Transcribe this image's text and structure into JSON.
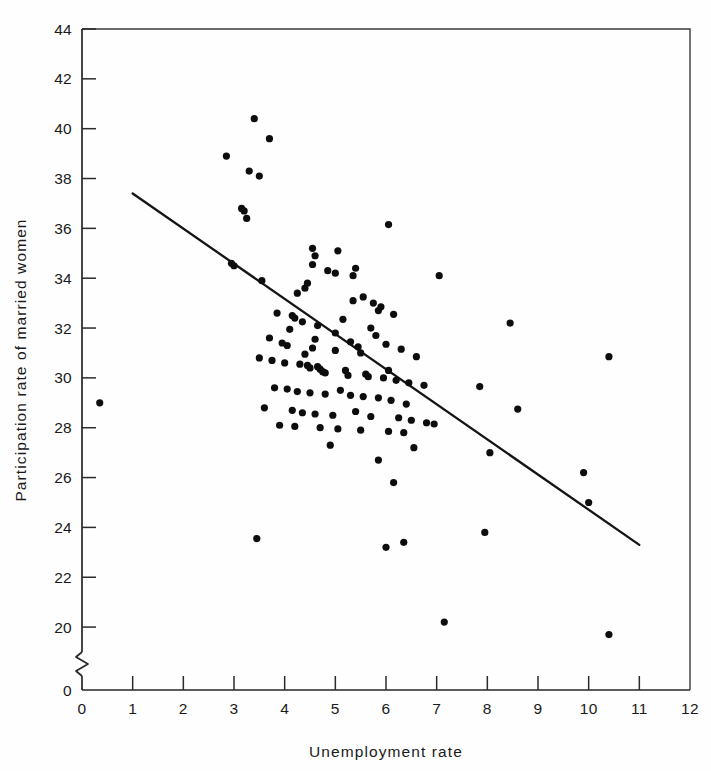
{
  "chart_data": {
    "type": "scatter",
    "title": "",
    "xlabel": "Unemployment rate",
    "ylabel": "Participation rate of married women",
    "xlim": [
      0,
      12
    ],
    "ylim": [
      19,
      44
    ],
    "grid": false,
    "legend": "none",
    "axis_break": {
      "axis": "y",
      "between": [
        0,
        19
      ],
      "zero_label": "0"
    },
    "xticks": [
      0,
      1,
      2,
      3,
      4,
      5,
      6,
      7,
      8,
      9,
      10,
      11,
      12
    ],
    "xticklabels": [
      "0",
      "1",
      "2",
      "3",
      "4",
      "5",
      "6",
      "7",
      "8",
      "9",
      "10",
      "11",
      "12"
    ],
    "yticks": [
      20,
      22,
      24,
      26,
      28,
      30,
      32,
      34,
      36,
      38,
      40,
      42,
      44
    ],
    "yticklabels": [
      "20",
      "22",
      "24",
      "26",
      "28",
      "30",
      "32",
      "34",
      "36",
      "38",
      "40",
      "42",
      "44"
    ],
    "y_zero_tick_label": "0",
    "marker": "filled-circle",
    "marker_color": "#0d0d0d",
    "series": [
      {
        "name": "states",
        "x": [
          0.35,
          2.85,
          3.4,
          3.7,
          3.3,
          3.5,
          3.15,
          3.2,
          3.25,
          2.95,
          3.0,
          6.05,
          4.55,
          4.6,
          4.55,
          5.05,
          4.85,
          5.0,
          5.4,
          5.35,
          3.55,
          4.45,
          4.4,
          4.25,
          5.55,
          5.35,
          5.75,
          5.9,
          5.85,
          7.05,
          3.85,
          4.15,
          4.2,
          4.35,
          4.1,
          4.65,
          5.15,
          5.0,
          5.7,
          5.8,
          6.15,
          3.7,
          3.95,
          4.05,
          4.6,
          4.55,
          5.0,
          4.4,
          5.3,
          5.45,
          5.5,
          6.0,
          6.3,
          6.6,
          6.05,
          8.45,
          3.5,
          3.75,
          4.0,
          4.3,
          4.45,
          4.5,
          4.65,
          4.7,
          4.75,
          4.8,
          5.2,
          5.25,
          5.6,
          5.65,
          5.95,
          6.2,
          6.45,
          6.75,
          3.8,
          4.05,
          4.25,
          4.5,
          4.8,
          5.1,
          5.3,
          5.55,
          5.85,
          6.1,
          6.4,
          7.85,
          8.05,
          3.6,
          4.15,
          4.35,
          4.6,
          4.95,
          5.4,
          5.7,
          6.25,
          6.5,
          6.8,
          10.4,
          3.9,
          4.2,
          4.7,
          5.05,
          5.5,
          6.05,
          6.35,
          6.95,
          8.6,
          3.45,
          4.9,
          5.85,
          6.15,
          6.55,
          7.95,
          9.9,
          10.0,
          6.0,
          6.35,
          7.15,
          10.4
        ],
        "y": [
          29.0,
          38.9,
          40.4,
          39.6,
          38.3,
          38.1,
          36.8,
          36.7,
          36.4,
          34.6,
          34.5,
          36.15,
          35.2,
          34.9,
          34.55,
          35.1,
          34.3,
          34.2,
          34.4,
          34.1,
          33.9,
          33.8,
          33.6,
          33.4,
          33.25,
          33.1,
          33.0,
          32.85,
          32.7,
          34.1,
          32.6,
          32.5,
          32.4,
          32.25,
          31.95,
          32.1,
          32.35,
          31.8,
          32.0,
          31.7,
          32.55,
          31.6,
          31.4,
          31.3,
          31.55,
          31.2,
          31.1,
          30.95,
          31.45,
          31.25,
          31.0,
          31.35,
          31.15,
          30.85,
          30.3,
          32.2,
          30.8,
          30.7,
          30.6,
          30.55,
          30.5,
          30.4,
          30.45,
          30.35,
          30.25,
          30.2,
          30.3,
          30.1,
          30.15,
          30.05,
          30.0,
          29.9,
          29.8,
          29.7,
          29.6,
          29.55,
          29.45,
          29.4,
          29.35,
          29.5,
          29.3,
          29.25,
          29.2,
          29.1,
          28.95,
          29.65,
          27.0,
          28.8,
          28.7,
          28.6,
          28.55,
          28.5,
          28.65,
          28.45,
          28.4,
          28.3,
          28.2,
          30.85,
          28.1,
          28.05,
          28.0,
          27.95,
          27.9,
          27.85,
          27.8,
          28.15,
          28.75,
          23.55,
          27.3,
          26.7,
          25.8,
          27.2,
          23.8,
          26.2,
          25.0,
          23.2,
          23.4,
          20.2,
          19.7
        ]
      }
    ],
    "fit_line": {
      "name": "regression-line",
      "x": [
        1.0,
        11.0
      ],
      "y": [
        37.4,
        23.3
      ]
    }
  }
}
